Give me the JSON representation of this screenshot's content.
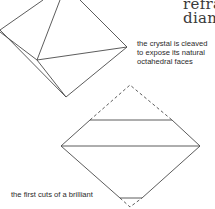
{
  "title": {
    "line1": "refra",
    "line2": "diam"
  },
  "captions": {
    "cleaved": [
      "the crystal is cleaved",
      "to expose its natural",
      "octahedral faces"
    ],
    "first_cuts": "the first cuts of a brilliant"
  },
  "colors": {
    "line": "#4a4a4a",
    "text": "#2a2a2a",
    "background": "#ffffff"
  }
}
